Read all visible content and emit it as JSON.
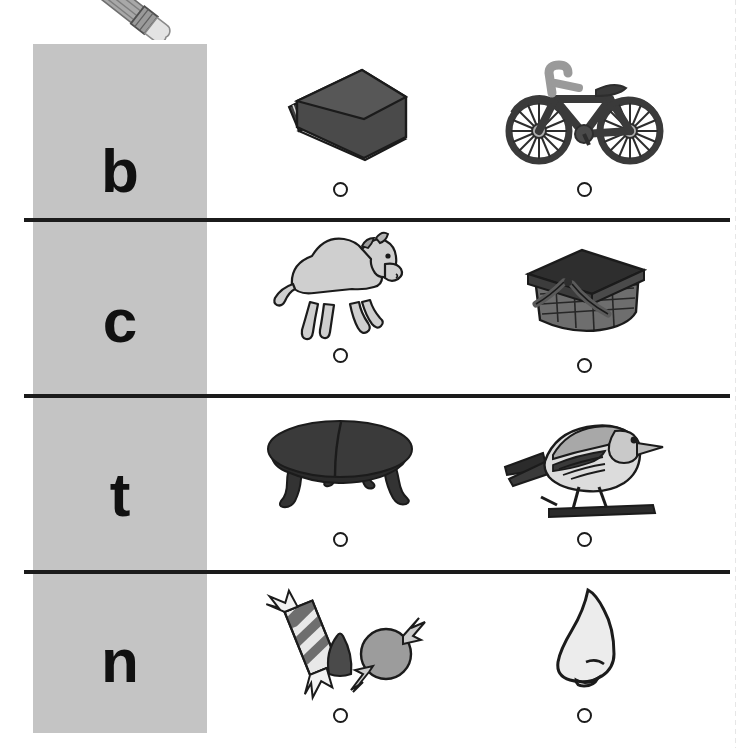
{
  "worksheet": {
    "title": "Beginning Sound Letter Matching Worksheet",
    "background_color": "#ffffff",
    "letter_column_color": "#c4c4c4",
    "line_color": "#1b1b1b",
    "decoration": {
      "name": "pencil",
      "label": "pencil",
      "body_color": "#9a9a9a",
      "ferrule_color": "#8c8c8c",
      "eraser_color": "#e0e0e0"
    },
    "rows": [
      {
        "letter": "b",
        "items": [
          {
            "label": "book",
            "icon": "book-illustration",
            "bubble": "answer-bubble"
          },
          {
            "label": "bicycle",
            "icon": "bicycle-illustration",
            "bubble": "answer-bubble"
          }
        ]
      },
      {
        "letter": "c",
        "items": [
          {
            "label": "camel",
            "icon": "camel-illustration",
            "bubble": "answer-bubble"
          },
          {
            "label": "basket",
            "icon": "picnic-basket-illustration",
            "bubble": "answer-bubble"
          }
        ]
      },
      {
        "letter": "t",
        "items": [
          {
            "label": "table",
            "icon": "table-illustration",
            "bubble": "answer-bubble"
          },
          {
            "label": "bird",
            "icon": "bird-illustration",
            "bubble": "answer-bubble"
          }
        ]
      },
      {
        "letter": "n",
        "items": [
          {
            "label": "candy",
            "icon": "candy-illustration",
            "bubble": "answer-bubble"
          },
          {
            "label": "nose",
            "icon": "nose-illustration",
            "bubble": "answer-bubble"
          }
        ]
      }
    ]
  }
}
